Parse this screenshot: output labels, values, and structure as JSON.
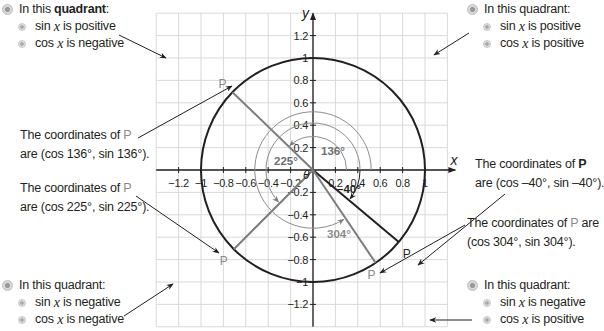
{
  "quadrants": {
    "top_left": {
      "heading_prefix": "In this ",
      "heading_bold": "quadrant",
      "heading_suffix": ":",
      "lines": [
        {
          "fn": "sin",
          "var": "x",
          "rest": " is positive"
        },
        {
          "fn": "cos",
          "var": "x",
          "rest": " is negative"
        }
      ]
    },
    "top_right": {
      "heading": "In this quadrant:",
      "lines": [
        {
          "fn": "sin",
          "var": "x",
          "rest": " is positive"
        },
        {
          "fn": "cos",
          "var": "x",
          "rest": " is positive"
        }
      ]
    },
    "bottom_left": {
      "heading": "In this quadrant:",
      "lines": [
        {
          "fn": "sin",
          "var": "x",
          "rest": " is negative"
        },
        {
          "fn": "cos",
          "var": "x",
          "rest": " is negative"
        }
      ]
    },
    "bottom_right": {
      "heading": "In this quadrant:",
      "lines": [
        {
          "fn": "sin",
          "var": "x",
          "rest": " is negative"
        },
        {
          "fn": "cos",
          "var": "x",
          "rest": " is positive"
        }
      ]
    }
  },
  "coordinates_notes": {
    "p136": {
      "line1": "The coordinates of ",
      "p": "P",
      "line2": "are (cos 136°, sin 136°)."
    },
    "p225": {
      "line1": "The coordinates of ",
      "p": "P",
      "line2": "are (cos 225°, sin 225°)."
    },
    "pneg40": {
      "line1": "The coordinates of ",
      "p": "P",
      "line2": "are (cos –40°, sin –40°)."
    },
    "p304": {
      "line1": "The coordinates of ",
      "p": "P",
      "line1_suffix": " are",
      "line2": "(cos 304°, sin 304°)."
    }
  },
  "chart_data": {
    "type": "unit-circle-diagram",
    "title": "",
    "xlabel": "x",
    "ylabel": "y",
    "xlim": [
      -1.4,
      1.2
    ],
    "ylim": [
      -1.4,
      1.4
    ],
    "grid": true,
    "grid_step": 0.2,
    "x_tick_labels": [
      "−1.2",
      "−1",
      "−0.8",
      "−0.6",
      "−0.4",
      "−0.2",
      "0.2",
      "0.4",
      "0.6",
      "0.8",
      "1"
    ],
    "y_tick_labels": [
      "1.2",
      "1",
      "0.8",
      "0.6",
      "0.4",
      "0.2",
      "−0.2",
      "−0.4",
      "−0.6",
      "−0.8",
      "−1",
      "−1.2"
    ],
    "origin_label": "0",
    "circle": {
      "center": [
        0,
        0
      ],
      "radius": 1
    },
    "angles": [
      {
        "label": "136°",
        "degrees": 136,
        "point_label": "P",
        "point": [
          -0.719,
          0.695
        ],
        "color": "#7d7d7d"
      },
      {
        "label": "225°",
        "degrees": 225,
        "point_label": "P",
        "point": [
          -0.707,
          -0.707
        ],
        "color": "#7d7d7d"
      },
      {
        "label": "–40°",
        "degrees": -40,
        "point_label": "P",
        "point": [
          0.766,
          -0.643
        ],
        "color": "#231f20"
      },
      {
        "label": "304°",
        "degrees": 304,
        "point_label": "P",
        "point": [
          0.559,
          -0.829
        ],
        "color": "#7d7d7d"
      }
    ]
  },
  "axis": {
    "x_label": "x",
    "y_label": "y",
    "x_ticks": [
      {
        "v": -1.2,
        "t": "−1.2"
      },
      {
        "v": -1,
        "t": "−1"
      },
      {
        "v": -0.8,
        "t": "−0.8"
      },
      {
        "v": -0.6,
        "t": "−0.6"
      },
      {
        "v": -0.4,
        "t": "−0.4"
      },
      {
        "v": -0.2,
        "t": "−0.2"
      },
      {
        "v": 0.2,
        "t": "0.2"
      },
      {
        "v": 0.4,
        "t": "0.4"
      },
      {
        "v": 0.6,
        "t": "0.6"
      },
      {
        "v": 0.8,
        "t": "0.8"
      },
      {
        "v": 1,
        "t": "1"
      }
    ],
    "y_ticks": [
      {
        "v": 1.2,
        "t": "1.2"
      },
      {
        "v": 1,
        "t": "1"
      },
      {
        "v": 0.8,
        "t": "0.8"
      },
      {
        "v": 0.6,
        "t": "0.6"
      },
      {
        "v": 0.4,
        "t": "0.4"
      },
      {
        "v": 0.2,
        "t": "0.2"
      },
      {
        "v": -0.2,
        "t": "−0.2"
      },
      {
        "v": -0.4,
        "t": "−0.4"
      },
      {
        "v": -0.6,
        "t": "−0.6"
      },
      {
        "v": -0.8,
        "t": "−0.8"
      },
      {
        "v": -1,
        "t": "−1"
      },
      {
        "v": -1.2,
        "t": "−1.2"
      }
    ]
  },
  "colors": {
    "text": "#231f20",
    "gray_line": "#7d7d7d",
    "arc_gray": "#8c8c8c",
    "grid": "#d9d9d9",
    "p_gray": "#8a8a8a"
  },
  "labels": {
    "angle_136": "136°",
    "angle_225": "225°",
    "angle_neg40": "–40°",
    "angle_304": "304°",
    "theta": "θ",
    "p": "P"
  }
}
